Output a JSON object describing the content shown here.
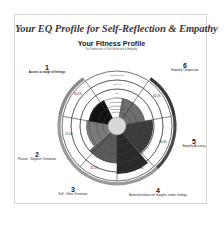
{
  "header": {
    "title": "Your EQ Profile for Self-Reflection & Empathy",
    "subtitle": "Your Fitness Profile",
    "caption": "Six Dimensions of Self-Reflection & Empathy"
  },
  "wheel": {
    "ring_labels": [
      "Good Enough",
      "Functional 40",
      "70",
      "Very Fit",
      "Optimally Fit"
    ],
    "dimensions": [
      {
        "number": "1",
        "label": "Access to range of feelings",
        "percent": "60.0%",
        "shade": "#111111",
        "arc_color": "#8a8a8a"
      },
      {
        "number": "2",
        "label": "Positive - Negative Orientation",
        "percent": "15.0%",
        "shade": "#cfcfcf",
        "arc_color": "#9a9a9a"
      },
      {
        "number": "3",
        "label": "Self - Other Orientation",
        "percent": "35.0%",
        "shade": "#5a5a5a",
        "arc_color": "#9a9a9a"
      },
      {
        "number": "4",
        "label": "Balanced reliance on thoughts, needs, feelings",
        "percent": "77.5%",
        "shade": "#2a2a2a",
        "arc_color": "#9a9a9a"
      },
      {
        "number": "5",
        "label": "Empathy Accuracy",
        "percent": "60.0%",
        "shade": "#3c3c3c",
        "arc_color": "#4a4a4a"
      },
      {
        "number": "6",
        "label": "Empathy Compassion",
        "percent": "65.0%",
        "shade": "#6e6e6e",
        "arc_color": "#3a3a3a"
      }
    ]
  }
}
